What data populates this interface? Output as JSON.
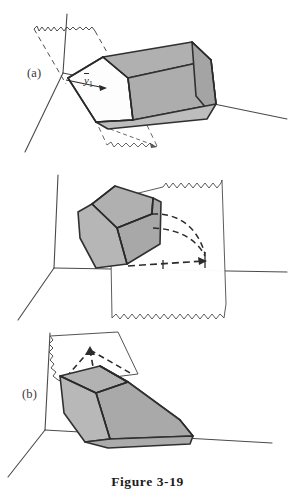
{
  "figure": {
    "caption": "Figure 3-19",
    "background_color": "#ffffff",
    "ink_color": "#2b2b2b",
    "solid_fill_color": "#b0b0b0",
    "solid_fill_color_dark": "#a2a2a2",
    "plane_fill_color": "#ffffff",
    "axis_color": "#4a4a4a"
  },
  "panels": [
    {
      "id": "a",
      "label": "(a)",
      "cut_label_base": "y",
      "cut_label_sub": "1",
      "description": "Gray prismatic solid cut by a sheet plane; dashed torn-edge plane at upper left and lower right, arrow to y-bar-1 along the cut",
      "axes": {
        "origin_x": 63,
        "origin_y": 73,
        "vertical_tip_y": 14,
        "horizontal_tip_x": 287,
        "diagonal_tip_x": 25,
        "diagonal_tip_y": 152
      }
    },
    {
      "id": "b",
      "label": "(b)",
      "cut_label_base": "y",
      "cut_label_sub": "2",
      "description": "Gray solid seen end-on at left with a tilted torn-edge cutting plane at right; dashed projection curves converge to a point, arrow to y-bar-2",
      "axes": {
        "origin_x": 54,
        "origin_y": 268,
        "vertical_tip_y": 175,
        "horizontal_tip_x": 287,
        "diagonal_tip_x": 18,
        "diagonal_tip_y": 320
      }
    },
    {
      "id": "c",
      "label": "(c)",
      "cut_label_base": "y",
      "cut_label_sub": "3",
      "description": "Gray solid resting low with a near-horizontal torn-edge plane above it; three dashed lines converge upward to a point labeled y-bar-3",
      "axes": {
        "origin_x": 45,
        "origin_y": 430,
        "vertical_tip_y": 333,
        "horizontal_tip_x": 272,
        "diagonal_tip_x": 8,
        "diagonal_tip_y": 477
      }
    }
  ]
}
